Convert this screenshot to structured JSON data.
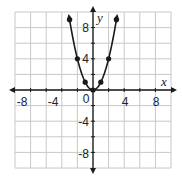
{
  "chart_data": {
    "type": "line",
    "title": "",
    "xlabel": "x",
    "ylabel": "y",
    "xlim": [
      -10,
      10
    ],
    "ylim": [
      -10,
      10
    ],
    "grid": true,
    "grid_step": 2,
    "x_ticks": [
      "-8",
      "-4",
      "0",
      "4",
      "8"
    ],
    "y_ticks": [
      "8",
      "4",
      "-4",
      "-8"
    ],
    "origin_label": "0",
    "series": [
      {
        "name": "y = x^2",
        "x": [
          -3,
          -2,
          -1,
          0,
          1,
          2,
          3
        ],
        "values": [
          9,
          4,
          1,
          0,
          1,
          4,
          9
        ],
        "arrow_ends": true,
        "markers": true
      }
    ],
    "colors": {
      "curve": "#1a1a1a",
      "grid": "#c8c8c8",
      "axes": "#1a1a1a"
    }
  }
}
